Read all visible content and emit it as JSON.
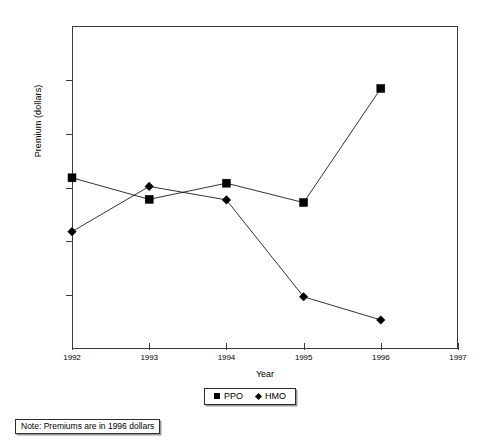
{
  "chart_data": {
    "type": "line",
    "title": "",
    "xlabel": "Year",
    "ylabel": "Premium (dollars)",
    "x": [
      1992,
      1993,
      1994,
      1995,
      1996
    ],
    "xtick_labels": [
      "1992",
      "1993",
      "1994",
      "1995",
      "1996",
      "1997"
    ],
    "xlim": [
      1992,
      1997
    ],
    "ylim": [
      5000,
      8000
    ],
    "ytick_labels": [
      "$8,000",
      "$7,500",
      "$7,000",
      "$6,500",
      "$6,000",
      "$5,500",
      "$5,000"
    ],
    "ytick_values": [
      8000,
      7500,
      7000,
      6500,
      6000,
      5500,
      5000
    ],
    "grid": false,
    "legend_position": "below-center",
    "series": [
      {
        "name": "PPO",
        "marker": "square",
        "color": "#000000",
        "values": [
          6590,
          6390,
          6540,
          6360,
          7420
        ]
      },
      {
        "name": "HMO",
        "marker": "diamond",
        "color": "#000000",
        "values": [
          6090,
          6510,
          6385,
          5485,
          5270
        ]
      }
    ],
    "annotations": [
      "Note: Premiums are in 1996 dollars"
    ]
  },
  "axes": {
    "y_title": "Premium (dollars)",
    "x_title": "Year",
    "y_ticks": [
      {
        "label": "$8,000",
        "value": 8000
      },
      {
        "label": "$7,500",
        "value": 7500
      },
      {
        "label": "$7,000",
        "value": 7000
      },
      {
        "label": "$6,500",
        "value": 6500
      },
      {
        "label": "$6,000",
        "value": 6000
      },
      {
        "label": "$5,500",
        "value": 5500
      },
      {
        "label": "$5,000",
        "value": 5000
      }
    ],
    "x_ticks": [
      {
        "label": "1992",
        "value": 1992
      },
      {
        "label": "1993",
        "value": 1993
      },
      {
        "label": "1994",
        "value": 1994
      },
      {
        "label": "1995",
        "value": 1995
      },
      {
        "label": "1996",
        "value": 1996
      },
      {
        "label": "1997",
        "value": 1997
      }
    ]
  },
  "legend": {
    "entries": [
      {
        "label": "PPO",
        "marker": "square"
      },
      {
        "label": "HMO",
        "marker": "diamond"
      }
    ]
  },
  "note": {
    "text": "Note: Premiums are in 1996 dollars"
  }
}
